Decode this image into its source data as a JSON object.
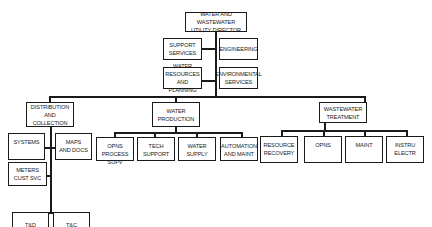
{
  "org_chart": {
    "director": "WATER AND WASTEWATER\nUTILITY DIRECTOR",
    "staff": {
      "support_services": "SUPPORT\nSERVICES",
      "engineering": "ENGINEERING",
      "water_resources": "WATER RESOURCES\nAND PLANNING",
      "environmental_services": "ENVIRONMENTAL\nSERVICES"
    },
    "divisions": {
      "distribution": {
        "label": "DISTRIBUTION\nAND COLLECTION",
        "units": {
          "systems": "SYSTEMS",
          "maps_docs": "MAPS\nAND DOCS",
          "meters": "METERS\nCUST SVC",
          "td": "T&D",
          "tc": "T&C"
        }
      },
      "production": {
        "label": "WATER\nPRODUCTION",
        "units": {
          "opns": "OPNS\nPROCESS SUPV",
          "tech": "TECH\nSUPPORT",
          "supply": "WATER\nSUPPLY",
          "automation": "AUTOMATION\nAND MAINT"
        }
      },
      "wastewater": {
        "label": "WASTEWATER\nTREATMENT",
        "units": {
          "resource": "RESOURCE\nRECOVERY",
          "opns": "OPNS",
          "maint": "MAINT",
          "instru": "INSTRU\nELECTR"
        }
      }
    }
  }
}
